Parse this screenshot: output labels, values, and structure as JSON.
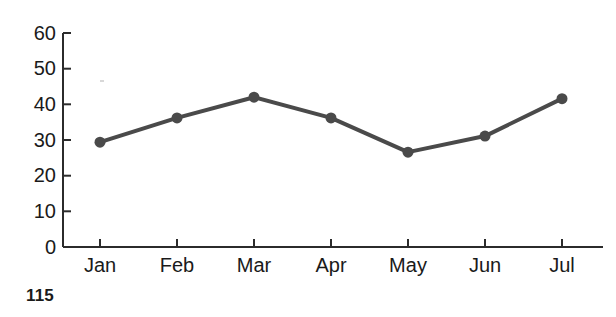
{
  "page": {
    "page_number": "115",
    "background_color": "#ffffff"
  },
  "chart_data": {
    "type": "line",
    "title": "",
    "subtitle": "",
    "xlabel": "",
    "ylabel": "",
    "categories": [
      "Jan",
      "Feb",
      "Mar",
      "Apr",
      "May",
      "Jun",
      "Jul"
    ],
    "values": [
      29.4,
      36.2,
      42.0,
      36.2,
      26.6,
      31.1,
      41.6
    ],
    "series": [
      {
        "name": "",
        "values": [
          29.4,
          36.2,
          42.0,
          36.2,
          26.6,
          31.1,
          41.6
        ]
      }
    ],
    "ylim": [
      0,
      60
    ],
    "yticks": [
      0,
      10,
      20,
      30,
      40,
      50,
      60
    ],
    "ytick_labels": [
      "0",
      "10",
      "20",
      "30",
      "40",
      "50",
      "60"
    ],
    "xtick_labels": [
      "Jan",
      "Feb",
      "Mar",
      "Apr",
      "May",
      "Jun",
      "Jul"
    ],
    "grid": false,
    "legend": false,
    "legend_position": "none",
    "annotations": [],
    "line_color": "#4a4a4a",
    "marker_color": "#4a4a4a",
    "axis_color": "#2b2b2b",
    "line_width": 4,
    "marker_radius": 5.5
  }
}
